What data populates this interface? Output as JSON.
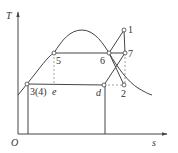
{
  "diagram": {
    "type": "T-s diagram",
    "axes": {
      "y_label": "T",
      "x_label": "s",
      "origin_label": "O"
    },
    "points": [
      {
        "id": "1",
        "label": "1"
      },
      {
        "id": "2",
        "label": "2"
      },
      {
        "id": "3",
        "label": "3(4)"
      },
      {
        "id": "5",
        "label": "5"
      },
      {
        "id": "6",
        "label": "6"
      },
      {
        "id": "7",
        "label": "7"
      },
      {
        "id": "d",
        "label": "d"
      },
      {
        "id": "e",
        "label": "e"
      }
    ],
    "colors": {
      "line": "#444444",
      "dashed": "#888888",
      "background": "#ffffff"
    }
  }
}
